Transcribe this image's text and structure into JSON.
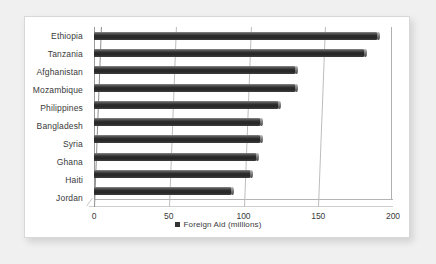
{
  "chart_data": {
    "type": "bar",
    "orientation": "horizontal",
    "title": "",
    "xlabel": "",
    "ylabel": "",
    "xlim": [
      0,
      200
    ],
    "xticks": [
      0,
      50,
      100,
      150,
      200
    ],
    "grid": true,
    "legend_position": "bottom-center",
    "legend": [
      "Foreign Aid (millions)"
    ],
    "series_name": "Foreign Aid (millions)",
    "bar_color": "#2e2e2e",
    "categories": [
      "Ethiopia",
      "Tanzania",
      "Afghanistan",
      "Mozambique",
      "Philippines",
      "Bangladesh",
      "Syria",
      "Ghana",
      "Haiti",
      "Jordan"
    ],
    "values": [
      190,
      181,
      135,
      135,
      124,
      112,
      112,
      109,
      105,
      92
    ]
  },
  "legend": {
    "marker": "legend-swatch",
    "label": "Foreign Aid (millions)"
  }
}
